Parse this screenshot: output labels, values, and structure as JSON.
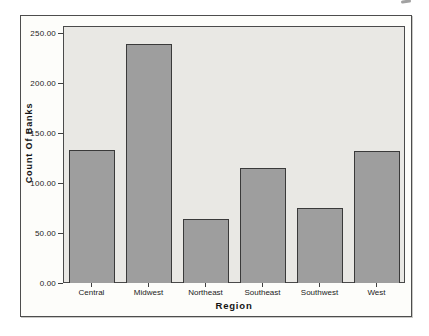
{
  "chart_data": {
    "type": "bar",
    "title": "",
    "xlabel": "Region",
    "ylabel": "Count Of Banks",
    "categories": [
      "Central",
      "Midwest",
      "Northeast",
      "Southeast",
      "Southwest",
      "West"
    ],
    "values": [
      133,
      239,
      64,
      115,
      75,
      132
    ],
    "ylim": [
      0,
      257
    ],
    "yticks": [
      {
        "label": "0.00",
        "value": 0
      },
      {
        "label": "50.00",
        "value": 50
      },
      {
        "label": "100.00",
        "value": 100
      },
      {
        "label": "150.00",
        "value": 150
      },
      {
        "label": "200.00",
        "value": 200
      },
      {
        "label": "250.00",
        "value": 250
      }
    ],
    "grid": false,
    "legend": "none",
    "colors": {
      "bar_fill": "#9e9e9e",
      "bar_border": "#3a3a3a",
      "plot_background": "#e9e8e4",
      "frame_border": "#4d4d4d",
      "page_background": "#ffffff",
      "text": "#1c1c1c"
    }
  }
}
